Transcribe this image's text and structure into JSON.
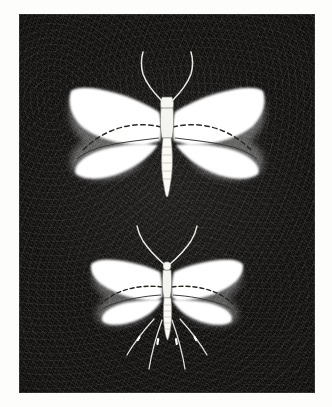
{
  "page": {
    "background_color": "#fdfdfc",
    "width": 332,
    "height": 407
  },
  "plate": {
    "name": "moth-specimen-plate",
    "background_color": "#0d0c0b",
    "texture": "dark-grainy-photographic-ground",
    "border_color": "#ffffff",
    "caption": ""
  },
  "specimens": [
    {
      "id": "upper-moth",
      "label": "upper-moth-specimen",
      "position": "top",
      "wing_color": "#ffffff",
      "body_color": "#f2f2ee",
      "marking_color": "#2a2a28",
      "relative_size": "large",
      "parts": {
        "forewings": "broad-white-triangular",
        "hindwings": "rounded-white",
        "abdomen": "tapered-segmented",
        "antennae": "long-curved-pair",
        "wing_markings": "dashed-postmedian-line"
      }
    },
    {
      "id": "lower-moth",
      "label": "lower-moth-specimen",
      "position": "bottom",
      "wing_color": "#ffffff",
      "body_color": "#f2f2ee",
      "marking_color": "#2a2a28",
      "relative_size": "small",
      "parts": {
        "forewings": "narrow-white-elongate",
        "hindwings": "rounded-white",
        "abdomen": "slender-segmented",
        "antennae": "long-curved-pair",
        "legs": "four-long-spurred-legs",
        "wing_markings": "dashed-postmedian-line"
      }
    }
  ]
}
